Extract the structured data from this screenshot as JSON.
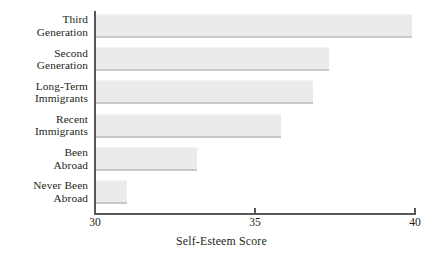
{
  "chart_data": {
    "type": "bar",
    "orientation": "horizontal",
    "title": "",
    "subtitle": "",
    "xlabel": "Self-Esteem Score",
    "ylabel": "",
    "xlim": [
      30,
      40
    ],
    "xticks": [
      30,
      35,
      40
    ],
    "xtick_labels": [
      "30",
      "35",
      "40"
    ],
    "grid": false,
    "legend": null,
    "categories": [
      "Third Generation",
      "Second Generation",
      "Long-Term Immigrants",
      "Recent Immigrants",
      "Been Abroad",
      "Never Been Abroad"
    ],
    "category_lines": [
      [
        "Third",
        "Generation"
      ],
      [
        "Second",
        "Generation"
      ],
      [
        "Long-Term",
        "Immigrants"
      ],
      [
        "Recent",
        "Immigrants"
      ],
      [
        "Been",
        "Abroad"
      ],
      [
        "Never Been",
        "Abroad"
      ]
    ],
    "values": [
      39.9,
      37.3,
      36.8,
      35.8,
      33.2,
      31.0
    ],
    "bar_color": "#ebebeb",
    "bar_edge_color": "#c9c9c9",
    "axis_color": "#58585a",
    "text_color": "#231f20"
  }
}
